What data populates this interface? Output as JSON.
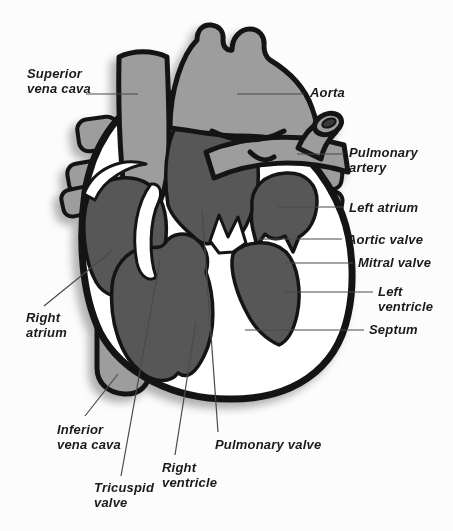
{
  "diagram": {
    "type": "heart-anatomy-cross-section",
    "labels": {
      "superior_vena_cava": "Superior\nvena cava",
      "aorta": "Aorta",
      "pulmonary_artery": "Pulmonary\nartery",
      "left_atrium": "Left atrium",
      "aortic_valve": "Aortic valve",
      "mitral_valve": "Mitral valve",
      "left_ventricle": "Left\nventricle",
      "septum": "Septum",
      "right_atrium": "Right\natrium",
      "inferior_vena_cava": "Inferior\nvena cava",
      "tricuspid_valve": "Tricuspid\nvalve",
      "right_ventricle": "Right\nventricle",
      "pulmonary_valve": "Pulmonary valve"
    }
  },
  "colors": {
    "background": "#fcfcfc",
    "vessel": "#9d9d9d",
    "chamber": "#575757",
    "heart_fill": "#ffffff",
    "outline": "#141414",
    "lumen": "#3a3a3a",
    "leader_line": "#4a4a4a",
    "label_text": "#1a1a1a"
  }
}
